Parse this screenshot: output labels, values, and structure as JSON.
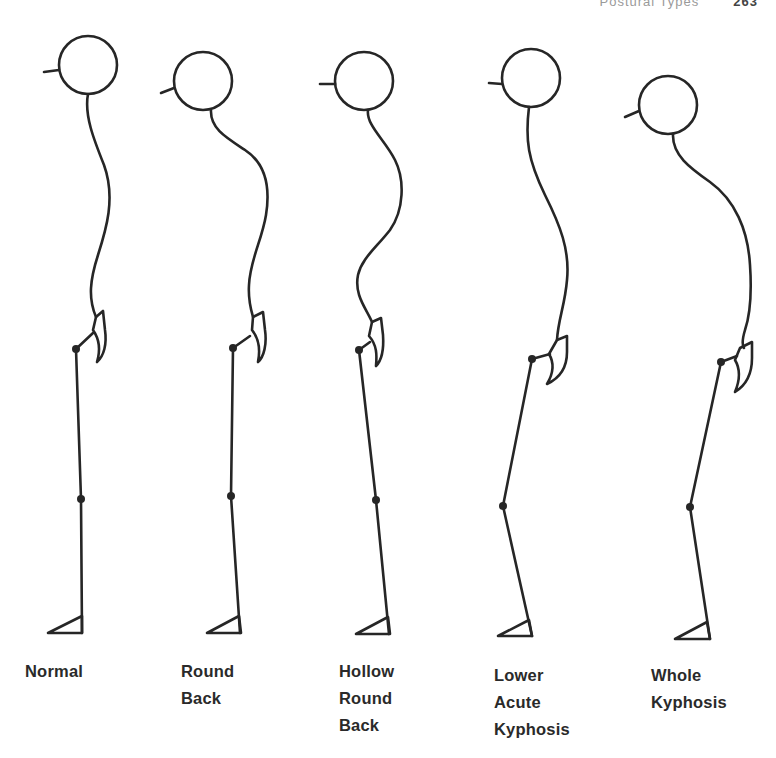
{
  "diagram": {
    "type": "posture-comparison",
    "header": {
      "running_text": "Postural Types",
      "page_number": "263"
    },
    "style": {
      "stroke": "#262626",
      "label_color": "#2a2a2a",
      "background": "#ffffff"
    },
    "figures": [
      {
        "id": "normal",
        "label": "Normal",
        "label_pos": [
          25,
          658
        ]
      },
      {
        "id": "round-back",
        "label": "Round\nBack",
        "label_pos": [
          181,
          658
        ]
      },
      {
        "id": "hollow-round-back",
        "label": "Hollow\nRound\nBack",
        "label_pos": [
          339,
          658
        ]
      },
      {
        "id": "lower-acute-kyphosis",
        "label": "Lower\nAcute\nKyphosis",
        "label_pos": [
          494,
          662
        ]
      },
      {
        "id": "whole-kyphosis",
        "label": "Whole\nKyphosis",
        "label_pos": [
          651,
          662
        ]
      }
    ]
  }
}
